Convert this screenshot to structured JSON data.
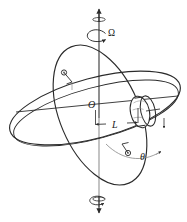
{
  "figure": {
    "type": "line-diagram",
    "background_color": "#ffffff",
    "stroke_color": "#2b2b2b",
    "shade_color": "#9a9a9a",
    "labels": {
      "spin_rate": "Ω",
      "center_point": "O",
      "arm_length": "L",
      "tilt_angle": "θ"
    },
    "elements": {
      "vertical_axis": "vertical-axis-line",
      "top_arrow": "axis-arrow-up",
      "bottom_arrow": "axis-arrow-down",
      "top_spin_arrow": "precession-arrow-top",
      "bottom_spin_arrow": "precession-arrow-bottom",
      "outer_ring": "outer-gimbal-ring",
      "inner_ring": "inner-gimbal-ring",
      "rotor": "rotor-disk",
      "pivot_upper": "pivot-bearing-upper",
      "pivot_lower": "pivot-bearing-lower",
      "dimension": "length-dimension-L",
      "angle_arc": "angle-arc-theta"
    }
  }
}
